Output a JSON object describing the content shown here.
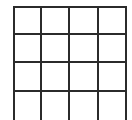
{
  "grid": {
    "rows": 4,
    "columns": 4,
    "line_color": "#2b2b2b",
    "background_color": "#ffffff",
    "line_width": 2,
    "x_lines": [
      14,
      41,
      69,
      98,
      126
    ],
    "y_lines": [
      7,
      34,
      62,
      91,
      121
    ],
    "cells": [
      [
        "",
        "",
        "",
        ""
      ],
      [
        "",
        "",
        "",
        ""
      ],
      [
        "",
        "",
        "",
        ""
      ],
      [
        "",
        "",
        "",
        ""
      ]
    ]
  }
}
